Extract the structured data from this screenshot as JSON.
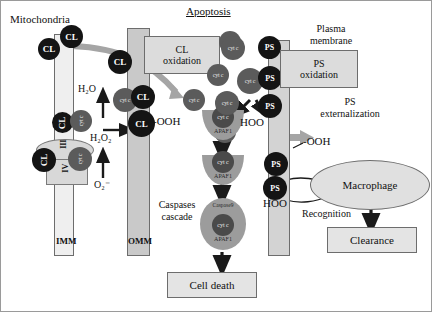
{
  "figure": {
    "title_left": "Mitochondria",
    "title_center": "Apoptosis",
    "title_right_line1": "Plasma",
    "title_right_line2": "membrane"
  },
  "membranes": {
    "inner": "IMM",
    "outer": "OMM"
  },
  "complexes": {
    "complex_iii": "III",
    "complex_iv": "IV"
  },
  "species": {
    "cl": "CL",
    "cytc": "cyt c",
    "ps": "PS",
    "cl_ooh": "CL-OOH",
    "hoo": "HOO",
    "ooh": "-OOH",
    "h2o": "H₂O",
    "h2o2": "H₂O₂",
    "o2_radical": "O₂⁻"
  },
  "boxes": {
    "cl_oxidation_line1": "CL",
    "cl_oxidation_line2": "oxidation",
    "ps_oxidation_line1": "PS",
    "ps_oxidation_line2": "oxidation",
    "cell_death": "Cell death",
    "clearance": "Clearance"
  },
  "annotations": {
    "caspases_line1": "Caspases",
    "caspases_line2": "cascade",
    "ps_ext_line1": "PS",
    "ps_ext_line2": "externalization",
    "macrophage": "Macrophage",
    "recognition": "Recognition"
  },
  "apoptosome": {
    "cytc": "cyt c",
    "apaf1": "APAF1",
    "caspase9": "Caspase9"
  },
  "colors": {
    "dark_circle": "#141414",
    "grey_circle": "#5b5b5b",
    "imm_fill": "#efefef",
    "omm_fill": "#c9c9c9",
    "pm_fill": "#d3d3d3",
    "box_fill": "#dcdcdc",
    "arrow_grey": "#9a9a9a",
    "outline": "#6d6d6d"
  }
}
